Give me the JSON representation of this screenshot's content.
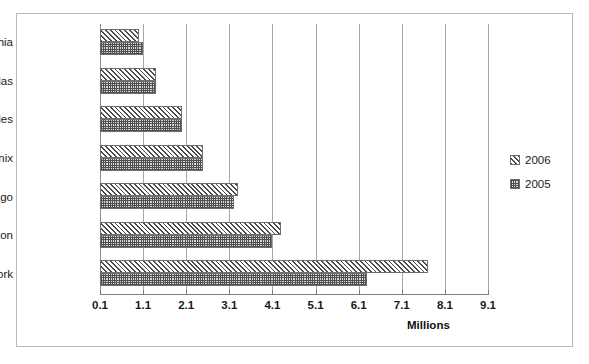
{
  "chart_data": {
    "type": "bar",
    "orientation": "horizontal",
    "title": "",
    "xlabel": "Millions",
    "ylabel": "",
    "categories": [
      "Philadelphia",
      "Dallas",
      "Los Angeles",
      "Phoenix",
      "Chicago",
      "Houston",
      "New York"
    ],
    "series": [
      {
        "name": "2006",
        "values": [
          1.0,
          1.4,
          2.0,
          2.5,
          3.3,
          4.3,
          7.7
        ]
      },
      {
        "name": "2005",
        "values": [
          1.1,
          1.4,
          2.0,
          2.5,
          3.2,
          4.1,
          6.3
        ]
      }
    ],
    "x_ticks": [
      "0.1",
      "1.1",
      "2.1",
      "3.1",
      "4.1",
      "5.1",
      "6.1",
      "7.1",
      "8.1",
      "9.1"
    ],
    "x_tick_values": [
      0.1,
      1.1,
      2.1,
      3.1,
      4.1,
      5.1,
      6.1,
      7.1,
      8.1,
      9.1
    ],
    "xlim": [
      0.1,
      9.1
    ],
    "grid": "vertical",
    "legend_position": "right",
    "legend": [
      "2006",
      "2005"
    ],
    "colors": {
      "pattern_2006": "#4a4a4a",
      "pattern_2005": "#4f4f4f",
      "gridline": "#a6a6a6",
      "border": "#b9b9b9",
      "text": "#1a1a1a"
    }
  },
  "axis": {
    "x_title": "Millions"
  },
  "legend": {
    "entries": [
      {
        "label": "2006",
        "swatch": "hatch-swatch"
      },
      {
        "label": "2005",
        "swatch": "checker-swatch"
      }
    ]
  }
}
